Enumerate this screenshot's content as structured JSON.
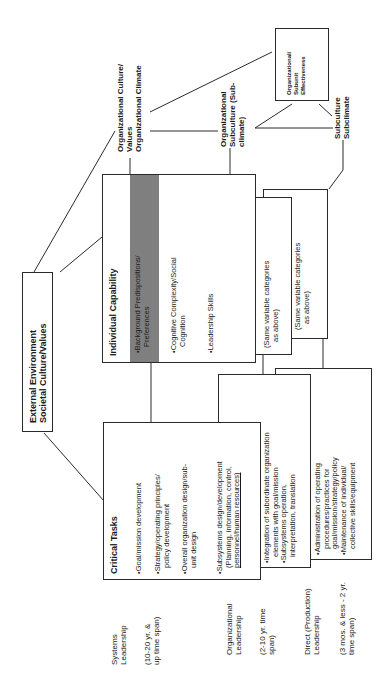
{
  "external": {
    "line1": "External Environment",
    "line2": "Societal Culture/Values"
  },
  "individual_capability": {
    "title": "Individual Capability",
    "items": [
      "•Background Predispositions/",
      "Preferences",
      "•Cognitive Complexity/Social",
      "Cognition",
      "•Leadership Skills"
    ]
  },
  "same_categories_1": {
    "line1": "(Same variable categories",
    "line2": "as above)"
  },
  "same_categories_2": {
    "line1": "(Same variable categories",
    "line2": "as above)"
  },
  "org_culture_label": {
    "line1": "Organizational Culture/",
    "line2": "Values",
    "line3": "Organizational Climate"
  },
  "org_subculture_label": {
    "line1": "Organizational",
    "line2": "Subculture (Sub-",
    "line3": "climate)"
  },
  "subculture_label": {
    "line1": "Subculture",
    "line2": "Subclimate"
  },
  "effectiveness": {
    "line1": "Organizational/",
    "line2": "Subunit",
    "line3": "Effectiveness"
  },
  "critical_tasks": {
    "title": "Critical Tasks",
    "items": [
      "•Goal/mission development",
      "•Strategy/operating principles/",
      "policy development",
      "•Overall organization design/sub-",
      "unit design",
      "•Subsystems design/development",
      "(Planning, information, control,",
      "personnel/human resources)"
    ]
  },
  "org_tasks": {
    "items": [
      "•Integration of subordinate organization",
      "elements with goal/mission",
      "•Subsystems operation,",
      "interpretation, translation"
    ]
  },
  "direct_tasks": {
    "items": [
      "•Administration of operating",
      "procedures/practices for",
      "goal/mission/strategy/policy",
      "•Maintenance of individual/",
      "collective skills/equipment"
    ]
  },
  "levels": {
    "systems": {
      "name1": "Systems",
      "name2": "Leadership",
      "span1": "(10-20 yr. &",
      "span2": "up time span)"
    },
    "organizational": {
      "name1": "Organizational",
      "name2": "Leadership",
      "span1": "(2-10 yr. time",
      "span2": "span)"
    },
    "direct": {
      "name1": "Direct (Production)",
      "name2": "Leadership",
      "span1": "(3 mos. & less - 2 yr.",
      "span2": "time span)"
    }
  }
}
